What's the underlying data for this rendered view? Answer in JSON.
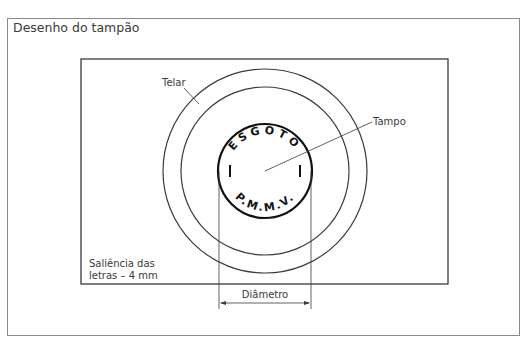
{
  "title": "Desenho do tampão",
  "labels": {
    "telar": "Telar",
    "tampo": "Tampo",
    "saliencia_line1": "Saliência das",
    "saliencia_line2": "letras – 4 mm",
    "diametro": "Diâmetro"
  },
  "stamp": {
    "top_text": "ESGOTO",
    "bottom_text": "P.M.M.V.",
    "side_marks": [
      "|",
      "|"
    ]
  },
  "colors": {
    "line": "#3a3a3a",
    "frame": "#8a8a8a",
    "stamp": "#111111"
  }
}
